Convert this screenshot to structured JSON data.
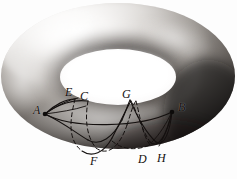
{
  "figure": {
    "name": "torus-with-curves",
    "caption": "",
    "background_color": "#ffffff",
    "ink_color": "#14100f",
    "surface": {
      "type": "torus",
      "outer_ellipse": {
        "cx": 118,
        "cy": 76,
        "rx": 117,
        "ry": 73
      },
      "hole_ellipse": {
        "cx": 118,
        "cy": 77,
        "rx": 58,
        "ry": 28
      },
      "highlight_color": "#f4f2f0",
      "shadow_color": "#1d1a19",
      "midtone_color": "#8d8985",
      "hole_fill": "#ffffff"
    },
    "points": [
      {
        "id": "A",
        "label": "A",
        "x": 44,
        "y": 114,
        "marker": true,
        "label_x": 36,
        "label_y": 106
      },
      {
        "id": "B",
        "label": "B",
        "x": 172,
        "y": 111,
        "marker": true,
        "label_x": 178,
        "label_y": 103
      },
      {
        "id": "C",
        "label": "C",
        "x": 86,
        "y": 100,
        "marker": false,
        "label_x": 82,
        "label_y": 92
      },
      {
        "id": "D",
        "label": "D",
        "x": 143,
        "y": 152,
        "marker": false,
        "label_x": 139,
        "label_y": 155
      },
      {
        "id": "E",
        "label": "E",
        "x": 74,
        "y": 98,
        "marker": false,
        "label_x": 68,
        "label_y": 89
      },
      {
        "id": "F",
        "label": "F",
        "x": 96,
        "y": 154,
        "marker": false,
        "label_x": 92,
        "label_y": 156
      },
      {
        "id": "G",
        "label": "G",
        "x": 127,
        "y": 100,
        "marker": false,
        "label_x": 124,
        "label_y": 91
      },
      {
        "id": "H",
        "label": "H",
        "x": 160,
        "y": 152,
        "marker": false,
        "label_x": 158,
        "label_y": 155
      }
    ],
    "curves": [
      {
        "id": "geodesic-ab",
        "from": "A",
        "to": "B",
        "style": "solid",
        "description": "near-straight arc across the front of the torus from A to B"
      },
      {
        "id": "helix-aefb",
        "from": "A",
        "to": "B",
        "style": "mixed",
        "description": "wavy helical path through E and F, dashed where hidden behind the tube"
      },
      {
        "id": "helix-acgd",
        "from": "A",
        "to": "B",
        "style": "mixed",
        "description": "wavy helical path through C, G and D, dashed where hidden"
      },
      {
        "id": "helix-ah",
        "from": "A",
        "to": "B",
        "style": "mixed",
        "description": "wavy helical path reaching H near B, dashed where hidden"
      }
    ],
    "line_styles": {
      "solid_width": 1.1,
      "dashed_width": 1.0,
      "dash_pattern": "4 3"
    }
  }
}
